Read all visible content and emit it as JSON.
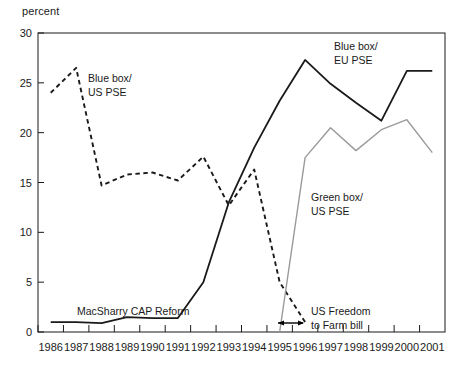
{
  "chart_data": {
    "type": "line",
    "title": "",
    "xlabel": "",
    "ylabel": "percent",
    "ylim": [
      0,
      30
    ],
    "yticks": [
      0,
      5,
      10,
      15,
      20,
      25,
      30
    ],
    "grid": false,
    "legend": "inline-annotations",
    "categories": [
      "1986",
      "1987",
      "1988",
      "1989",
      "1990",
      "1991",
      "1992",
      "1993",
      "1994",
      "1995",
      "1996",
      "1997",
      "1998",
      "1999",
      "2000",
      "2001"
    ],
    "x": [
      1986,
      1987,
      1988,
      1989,
      1990,
      1991,
      1992,
      1993,
      1994,
      1995,
      1996,
      1997,
      1998,
      1999,
      2000,
      2001
    ],
    "series": [
      {
        "name": "Blue box/ US PSE",
        "style": "dashed",
        "color": "#1a1a1a",
        "values": [
          24.0,
          26.5,
          14.7,
          15.8,
          16.0,
          15.2,
          17.6,
          12.7,
          16.3,
          5.0,
          1.0,
          null,
          null,
          null,
          null,
          null
        ]
      },
      {
        "name": "Blue box/ EU PSE",
        "style": "solid",
        "color": "#1a1a1a",
        "values": [
          1.0,
          1.0,
          0.9,
          1.5,
          1.4,
          1.4,
          5.0,
          13.0,
          18.5,
          23.2,
          27.3,
          24.9,
          23.0,
          21.2,
          26.2,
          26.2
        ]
      },
      {
        "name": "Green box/ US PSE",
        "style": "solid",
        "color": "#9a9a9a",
        "values": [
          null,
          null,
          null,
          null,
          null,
          null,
          null,
          null,
          null,
          0.0,
          17.5,
          20.5,
          18.2,
          20.3,
          21.3,
          18.0
        ]
      }
    ],
    "annotations": [
      {
        "id": "blue-box-us-pse",
        "text_lines": [
          "Blue box/",
          "US PSE"
        ],
        "x_px": 88,
        "y_px": 82
      },
      {
        "id": "blue-box-eu-pse",
        "text_lines": [
          "Blue box/",
          "EU PSE"
        ],
        "x_px": 334,
        "y_px": 50
      },
      {
        "id": "green-box-us-pse",
        "text_lines": [
          "Green box/",
          "US PSE"
        ],
        "x_px": 311,
        "y_px": 201
      },
      {
        "id": "macsharry-cap-reform",
        "text_lines": [
          "MacSharry CAP Reform"
        ],
        "x_px": 77,
        "y_px": 315
      },
      {
        "id": "us-freedom-to-farm-bill",
        "text_lines": [
          "US Freedom",
          "to Farm bill"
        ],
        "x_px": 311,
        "y_px": 315
      }
    ]
  },
  "axes": {
    "y_unit": "percent",
    "y_tick_labels": [
      "30",
      "25",
      "20",
      "15",
      "10",
      "5",
      "0"
    ],
    "x_tick_labels": [
      "1986",
      "1987",
      "1988",
      "1989",
      "1990",
      "1991",
      "1992",
      "1993",
      "1994",
      "1995",
      "1996",
      "1997",
      "1998",
      "1999",
      "2000",
      "2001"
    ]
  },
  "annotations_text": {
    "blue_box_us_pse_l1": "Blue box/",
    "blue_box_us_pse_l2": "US PSE",
    "blue_box_eu_pse_l1": "Blue box/",
    "blue_box_eu_pse_l2": "EU PSE",
    "green_box_us_pse_l1": "Green box/",
    "green_box_us_pse_l2": "US PSE",
    "macsharry": "MacSharry CAP Reform",
    "freedom_l1": "US Freedom",
    "freedom_l2": "to Farm bill"
  },
  "colors": {
    "axis": "#1a1a1a",
    "blue_box_series": "#1a1a1a",
    "green_box_series": "#9a9a9a",
    "background": "#ffffff"
  }
}
